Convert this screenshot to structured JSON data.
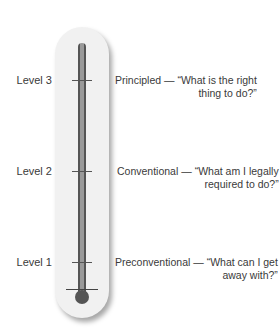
{
  "diagram": {
    "type": "thermometer",
    "levels": [
      {
        "label": "Level 3",
        "stage": "Principled",
        "dash": "—",
        "question_line1": "“What is the right",
        "question_line2": "thing to do?”"
      },
      {
        "label": "Level 2",
        "stage": "Conventional",
        "dash": "—",
        "question_line1": "“What am I legally",
        "question_line2": "required to do?”"
      },
      {
        "label": "Level 1",
        "stage": "Preconventional",
        "dash": "—",
        "question_line1": "“What can I get",
        "question_line2": "away with?”"
      }
    ]
  },
  "colors": {
    "body": "#f1f1f1",
    "tube": "#555555",
    "tube_highlight": "#9a9a9a",
    "text": "#3a3a3a"
  }
}
